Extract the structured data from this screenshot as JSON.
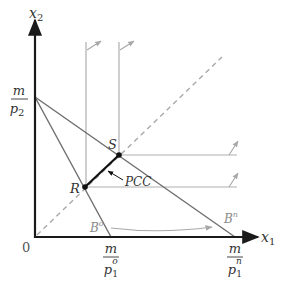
{
  "diagram": {
    "axes": {
      "x_label": "x",
      "x_sub": "1",
      "y_label": "x",
      "y_sub": "2",
      "origin_label": "0"
    },
    "intercepts": {
      "y_intercept": {
        "num": "m",
        "den": "p",
        "den_sub": "2"
      },
      "x_intercept_old": {
        "num": "m",
        "den": "p",
        "den_sub": "1",
        "den_sup": "o"
      },
      "x_intercept_new": {
        "num": "m",
        "den": "p",
        "den_sub": "1",
        "den_sup": "n"
      }
    },
    "points": {
      "R": "R",
      "S": "S"
    },
    "curve_label": "PCC",
    "budget_lines": {
      "old": {
        "letter": "B",
        "sup": "o"
      },
      "new": {
        "letter": "B",
        "sup": "n"
      }
    },
    "colors": {
      "axis": "#1a1a1a",
      "budget": "#6e6e6e",
      "indiff": "#a8a8a8",
      "dashed": "#a8a8a8",
      "pcc": "#111111",
      "label_gray": "#8a8a8a"
    }
  }
}
